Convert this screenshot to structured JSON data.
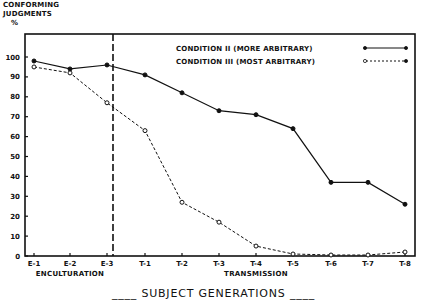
{
  "chart_data": {
    "type": "line",
    "title": "",
    "ylabel": "CONFORMING JUDGMENTS %",
    "xlabel": "SUBJECT GENERATIONS",
    "ylim": [
      0,
      100
    ],
    "yticks": [
      0,
      10,
      20,
      30,
      40,
      50,
      60,
      70,
      80,
      90,
      100
    ],
    "grid": false,
    "legend_position": "upper right",
    "categories": [
      "E-1",
      "E-2",
      "E-3",
      "T-1",
      "T-2",
      "T-3",
      "T-4",
      "T-5",
      "T-6",
      "T-7",
      "T-8"
    ],
    "series": [
      {
        "name": "CONDITION II (MORE ARBITRARY)",
        "style": "solid",
        "marker": "filled-circle",
        "values": [
          98,
          94,
          96,
          91,
          82,
          73,
          71,
          64,
          37,
          37,
          26
        ]
      },
      {
        "name": "CONDITION III (MOST ARBITRARY)",
        "style": "dashed",
        "marker": "open-circle",
        "values": [
          95,
          92,
          77,
          63,
          27,
          17,
          5,
          1,
          0.5,
          0.5,
          2
        ]
      }
    ],
    "annotations": [
      {
        "text": "ENCULTURATION",
        "spans": [
          "E-1",
          "E-3"
        ]
      },
      {
        "text": "TRANSMISSION",
        "spans": [
          "T-1",
          "T-8"
        ]
      },
      {
        "text": "vertical dashed divider between E-3 and T-1"
      }
    ]
  },
  "labels": {
    "ylabel_line1": "CONFORMING",
    "ylabel_line2": "JUDGMENTS",
    "ylabel_unit": "%",
    "xtitle": "SUBJECT GENERATIONS",
    "enculturation": "ENCULTURATION",
    "transmission": "TRANSMISSION",
    "legend_1": "CONDITION II (MORE ARBITRARY)",
    "legend_2": "CONDITION III (MOST ARBITRARY)"
  }
}
